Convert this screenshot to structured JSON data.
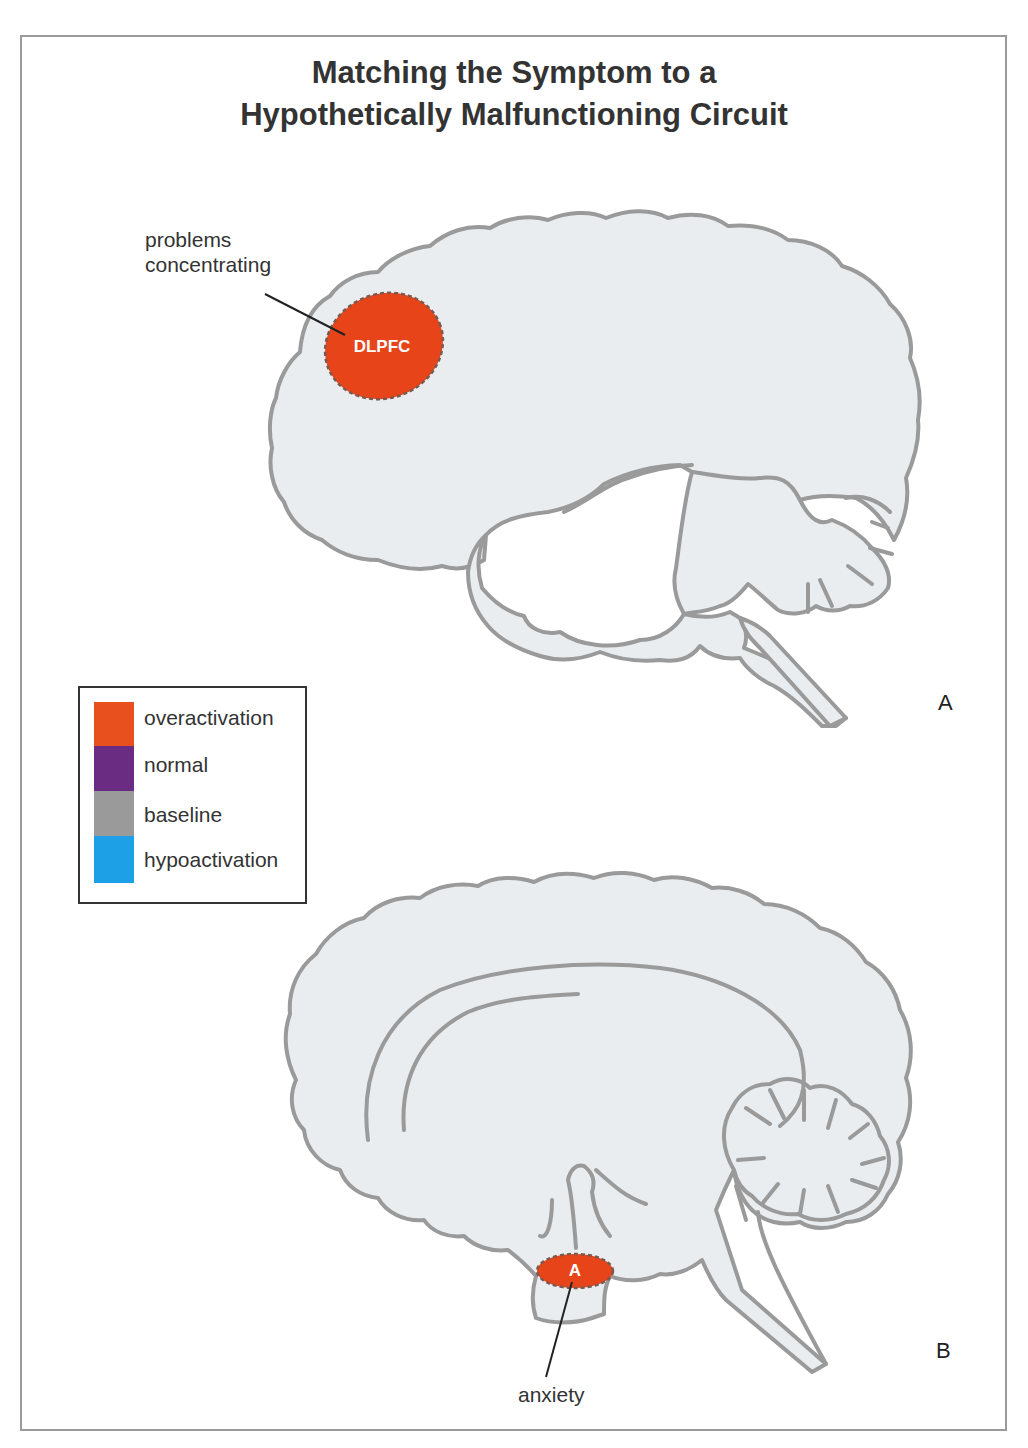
{
  "title": {
    "line1": "Matching the Symptom to a",
    "line2": "Hypothetically Malfunctioning Circuit"
  },
  "panels": [
    {
      "id": "A",
      "letter": "A",
      "view": "lateral brain",
      "regions": [
        {
          "abbr": "DLPFC",
          "state": "overactivation",
          "color": "#e8441a"
        }
      ],
      "annotations": [
        {
          "line1": "problems",
          "line2": "concentrating",
          "target": "DLPFC"
        }
      ]
    },
    {
      "id": "B",
      "letter": "B",
      "view": "medial brain",
      "regions": [
        {
          "abbr": "A",
          "state": "overactivation",
          "color": "#e8441a"
        }
      ],
      "annotations": [
        {
          "text": "anxiety",
          "target": "A"
        }
      ]
    }
  ],
  "legend": {
    "items": [
      {
        "label": "overactivation",
        "color": "#e8501e"
      },
      {
        "label": "normal",
        "color": "#6a2c82"
      },
      {
        "label": "baseline",
        "color": "#9a9a9a"
      },
      {
        "label": "hypoactivation",
        "color": "#1ea0e6"
      }
    ]
  },
  "colors": {
    "brain_fill": "#e9edf0",
    "brain_outline": "#9a9a9a",
    "frame": "#9a9a9a"
  }
}
